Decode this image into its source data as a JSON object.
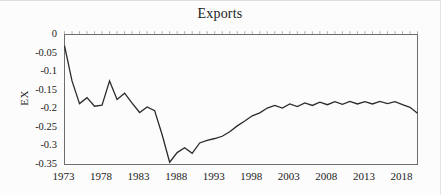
{
  "chart_data": {
    "type": "line",
    "title": "Exports",
    "xlabel": "",
    "ylabel": "EX",
    "grid": false,
    "legend": null,
    "xlim": [
      1973,
      2020
    ],
    "ylim": [
      -0.35,
      0
    ],
    "xticks": [
      "1973",
      "1978",
      "1983",
      "1988",
      "1993",
      "1998",
      "2003",
      "2008",
      "2013",
      "2018"
    ],
    "yticks": [
      "0",
      "-0.05",
      "-0.1",
      "-0.15",
      "-0.2",
      "-0.25",
      "-0.3",
      "-0.35"
    ],
    "x": [
      1973,
      1974,
      1975,
      1976,
      1977,
      1978,
      1979,
      1980,
      1981,
      1982,
      1983,
      1984,
      1985,
      1986,
      1987,
      1988,
      1989,
      1990,
      1991,
      1992,
      1993,
      1994,
      1995,
      1996,
      1997,
      1998,
      1999,
      2000,
      2001,
      2002,
      2003,
      2004,
      2005,
      2006,
      2007,
      2008,
      2009,
      2010,
      2011,
      2012,
      2013,
      2014,
      2015,
      2016,
      2017,
      2018,
      2019,
      2020
    ],
    "series": [
      {
        "name": "EX",
        "values": [
          -0.03,
          -0.125,
          -0.186,
          -0.17,
          -0.193,
          -0.19,
          -0.125,
          -0.175,
          -0.158,
          -0.185,
          -0.21,
          -0.195,
          -0.205,
          -0.27,
          -0.344,
          -0.318,
          -0.305,
          -0.32,
          -0.292,
          -0.285,
          -0.28,
          -0.274,
          -0.262,
          -0.246,
          -0.233,
          -0.219,
          -0.211,
          -0.198,
          -0.191,
          -0.198,
          -0.187,
          -0.194,
          -0.184,
          -0.191,
          -0.182,
          -0.189,
          -0.181,
          -0.188,
          -0.18,
          -0.187,
          -0.181,
          -0.187,
          -0.18,
          -0.186,
          -0.181,
          -0.189,
          -0.196,
          -0.212
        ]
      }
    ],
    "colors": {
      "line": "#2b2b2b",
      "frame": "#6e6e6e",
      "top_ticks": "#b3b3b3",
      "text": "#1c1c1c",
      "background": "#fcfcfc"
    }
  }
}
